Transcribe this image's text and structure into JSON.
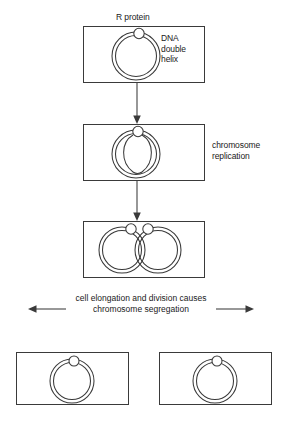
{
  "diagram": {
    "stroke_color": "#3a3a3a",
    "text_color": "#1a1a1a",
    "background": "#ffffff"
  },
  "labels": {
    "r_protein": "R protein",
    "dna_double_helix": "DNA\ndouble\nhelix",
    "chromosome_replication": "chromosome\nreplication",
    "segregation_caption": "cell elongation and\ndivision causes\nchromosome segregation"
  },
  "stages": [
    {
      "id": "stage-1",
      "name": "parent-cell-unreplicated",
      "chromosomes": 1,
      "proteins": 1,
      "label": "DNA double helix"
    },
    {
      "id": "stage-2",
      "name": "cell-replicating",
      "chromosomes": 1,
      "proteins": 1,
      "label": "chromosome replication"
    },
    {
      "id": "stage-3",
      "name": "cell-two-chromosomes",
      "chromosomes": 2,
      "proteins": 2,
      "label": ""
    },
    {
      "id": "stage-4-left",
      "name": "daughter-cell-left",
      "chromosomes": 1,
      "proteins": 1,
      "label": ""
    },
    {
      "id": "stage-4-right",
      "name": "daughter-cell-right",
      "chromosomes": 1,
      "proteins": 1,
      "label": ""
    }
  ]
}
